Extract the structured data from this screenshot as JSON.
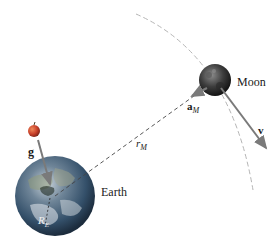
{
  "diagram": {
    "labels": {
      "moon": "Moon",
      "earth": "Earth",
      "velocity": "v",
      "gravity": "g",
      "moon_accel_main": "a",
      "moon_accel_sub": "M",
      "distance_main": "r",
      "distance_sub": "M",
      "earth_radius_main": "R",
      "earth_radius_sub": "E"
    },
    "objects": [
      {
        "name": "Earth",
        "shape": "sphere",
        "center": [
          55,
          196
        ],
        "radius": 40
      },
      {
        "name": "Moon",
        "shape": "sphere",
        "center": [
          215,
          80
        ],
        "radius": 16
      },
      {
        "name": "Apple",
        "shape": "sphere",
        "center": [
          34,
          131
        ],
        "radius": 6
      }
    ],
    "arrows": [
      {
        "name": "g",
        "from": [
          38,
          141
        ],
        "to": [
          50,
          185
        ]
      },
      {
        "name": "a_M",
        "from": [
          205,
          88
        ],
        "to": [
          190,
          96
        ]
      },
      {
        "name": "v",
        "from": [
          220,
          88
        ],
        "to": [
          267,
          150
        ]
      }
    ],
    "lines": [
      {
        "name": "r_M",
        "style": "dashed",
        "from": [
          55,
          196
        ],
        "to": [
          205,
          88
        ]
      },
      {
        "name": "orbit",
        "style": "dashed-arc"
      },
      {
        "name": "R_E",
        "style": "dashed",
        "from": [
          50,
          196
        ],
        "to": [
          45,
          225
        ]
      }
    ],
    "colors": {
      "arrow": "#8a8a8a",
      "orbit": "#b0b0b0",
      "dashed_line": "#444444",
      "moon": "#3a3a3a",
      "apple": "#cc4422",
      "earth_ocean": "#2b4a6b"
    }
  }
}
